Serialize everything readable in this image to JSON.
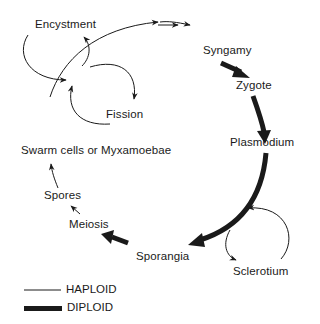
{
  "diagram": {
    "type": "life-cycle",
    "nodes": {
      "encystment": "Encystment",
      "syngamy": "Syngamy",
      "zygote": "Zygote",
      "fission": "Fission",
      "plasmodium": "Plasmodium",
      "swarm_cells": "Swarm cells or Myxamoebae",
      "spores": "Spores",
      "meiosis": "Meiosis",
      "sporangia": "Sporangia",
      "sclerotium": "Sclerotium"
    },
    "edges": [
      {
        "from": "Swarm cells or Myxamoebae",
        "to": "Syngamy",
        "ploidy": "haploid"
      },
      {
        "from": "Swarm cells or Myxamoebae",
        "to": "Encystment",
        "ploidy": "haploid",
        "loop": true
      },
      {
        "from": "Swarm cells or Myxamoebae",
        "to": "Fission",
        "ploidy": "haploid",
        "loop": true
      },
      {
        "from": "Syngamy",
        "to": "Zygote",
        "ploidy": "diploid"
      },
      {
        "from": "Zygote",
        "to": "Plasmodium",
        "ploidy": "diploid"
      },
      {
        "from": "Plasmodium",
        "to": "Sporangia",
        "ploidy": "diploid"
      },
      {
        "from": "Plasmodium",
        "to": "Sclerotium",
        "ploidy": "haploid",
        "loop": true
      },
      {
        "from": "Sporangia",
        "to": "Meiosis",
        "ploidy": "diploid"
      },
      {
        "from": "Meiosis",
        "to": "Spores",
        "ploidy": "haploid"
      },
      {
        "from": "Spores",
        "to": "Swarm cells or Myxamoebae",
        "ploidy": "haploid"
      }
    ]
  },
  "legend": {
    "haploid": "HAPLOID",
    "diploid": "DIPLOID"
  },
  "colors": {
    "ink": "#1a1a1a",
    "background": "#ffffff"
  }
}
